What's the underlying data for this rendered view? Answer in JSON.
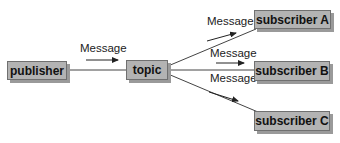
{
  "nodes": {
    "publisher": "publisher",
    "topic": "topic",
    "subscriber_a": "subscriber A",
    "subscriber_b": "subscriber B",
    "subscriber_c": "subscriber C"
  },
  "edges": [
    {
      "from": "publisher",
      "to": "topic",
      "label": "Message"
    },
    {
      "from": "topic",
      "to": "subscriber A",
      "label": "Message"
    },
    {
      "from": "topic",
      "to": "subscriber B",
      "label": "Message"
    },
    {
      "from": "topic",
      "to": "subscriber C",
      "label": "Message"
    }
  ],
  "colors": {
    "box_fill": "#b3b3b3",
    "box_border": "#707070",
    "line": "#444444"
  }
}
